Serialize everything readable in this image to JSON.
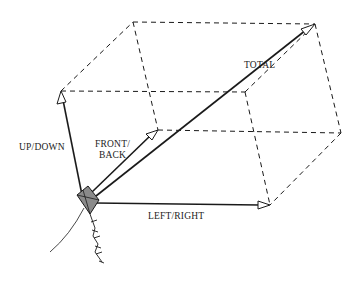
{
  "figure": {
    "labels": {
      "total": "TOTAL",
      "up_down": "UP/DOWN",
      "front_back_line1": "FRONT/",
      "front_back_line2": "BACK",
      "left_right": "LEFT/RIGHT"
    },
    "colors": {
      "line": "#1a1a1a",
      "kite_fill": "#8a8a8a",
      "background": "#ffffff"
    }
  }
}
